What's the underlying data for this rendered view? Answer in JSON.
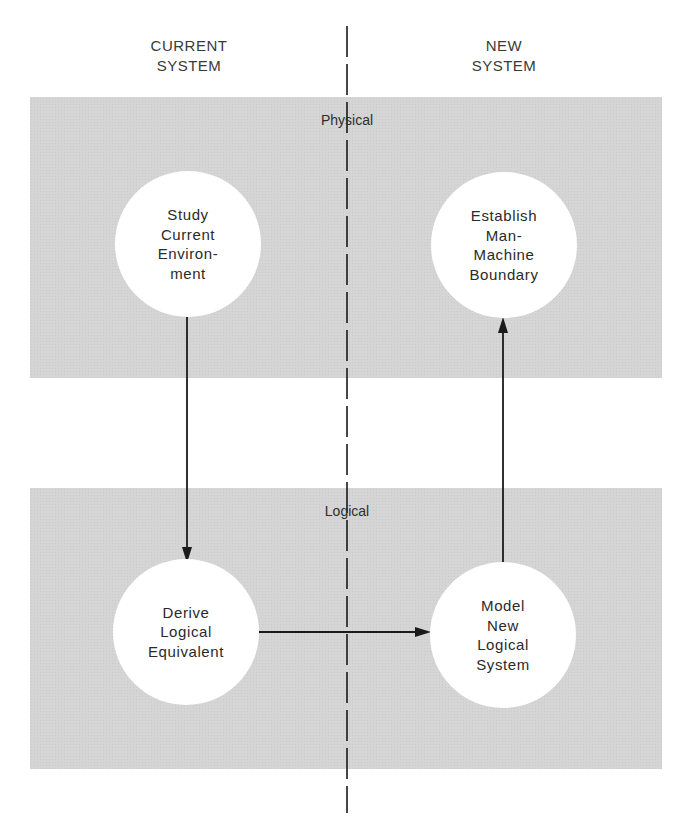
{
  "columns": {
    "current": {
      "line1": "CURRENT",
      "line2": "SYSTEM"
    },
    "new": {
      "line1": "NEW",
      "line2": "SYSTEM"
    }
  },
  "bands": {
    "physical": {
      "label": "Physical"
    },
    "logical": {
      "label": "Logical"
    }
  },
  "nodes": {
    "study": {
      "lines": [
        "Study",
        "Current",
        "Environ-",
        "ment"
      ]
    },
    "establish": {
      "lines": [
        "Establish",
        "Man-",
        "Machine",
        "Boundary"
      ]
    },
    "derive": {
      "lines": [
        "Derive",
        "Logical",
        "Equivalent"
      ]
    },
    "model": {
      "lines": [
        "Model",
        "New",
        "Logical",
        "System"
      ]
    }
  },
  "edges": [
    {
      "from": "Study Current Environment",
      "to": "Derive Logical Equivalent",
      "direction": "down"
    },
    {
      "from": "Derive Logical Equivalent",
      "to": "Model New Logical System",
      "direction": "right"
    },
    {
      "from": "Model New Logical System",
      "to": "Establish Man-Machine Boundary",
      "direction": "up"
    }
  ],
  "colors": {
    "band": "#d5d5d5",
    "node": "#ffffff",
    "line": "#1a1a1a"
  }
}
